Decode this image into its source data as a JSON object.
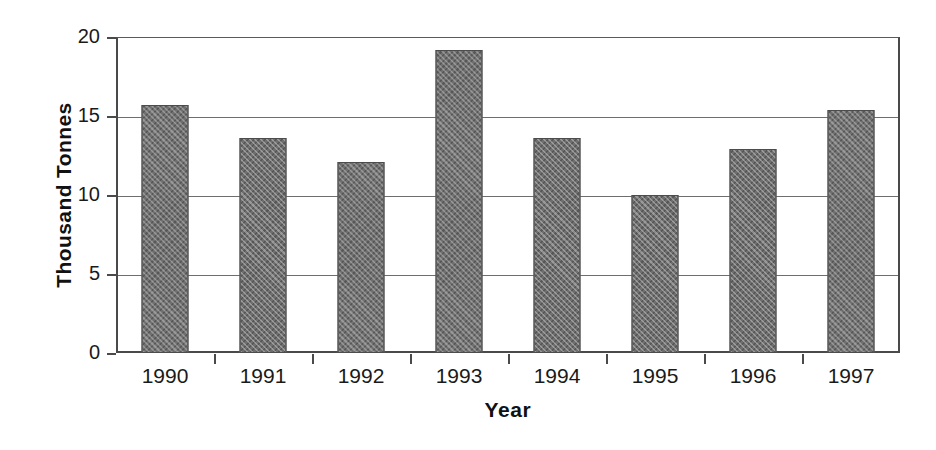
{
  "chart_data": {
    "type": "bar",
    "title": "",
    "xlabel": "Year",
    "ylabel": "Thousand Tonnes",
    "categories": [
      "1990",
      "1991",
      "1992",
      "1993",
      "1994",
      "1995",
      "1996",
      "1997"
    ],
    "values": [
      15.7,
      13.6,
      12.1,
      19.2,
      13.6,
      10.0,
      12.9,
      15.4
    ],
    "ylim": [
      0,
      20
    ],
    "yticks": [
      0,
      5,
      10,
      15,
      20
    ],
    "ytick_labels": [
      "0",
      "5",
      "10",
      "15",
      "20"
    ],
    "grid": true,
    "grid_axis": "y",
    "legend": false,
    "legend_position": "none",
    "series": [
      {
        "name": "Thousand Tonnes",
        "values": [
          15.7,
          13.6,
          12.1,
          19.2,
          13.6,
          10.0,
          12.9,
          15.4
        ]
      }
    ],
    "bar_fill_color": "#6f6f6f",
    "bar_edge_color": "#4c4c4c",
    "axis_color": "#4a4a4a",
    "background_color": "#ffffff"
  }
}
